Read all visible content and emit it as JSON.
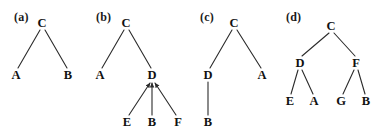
{
  "figure": {
    "width": 388,
    "height": 136,
    "background": "#ffffff",
    "stroke_color": "#2b2b2b",
    "text_color": "#111111"
  },
  "panels": [
    {
      "id": "panel-a",
      "label": "(a)",
      "label_x": 14,
      "label_y": 10,
      "nodes": [
        {
          "name": "C",
          "x": 42,
          "y": 23
        },
        {
          "name": "A",
          "x": 16,
          "y": 75
        },
        {
          "name": "B",
          "x": 68,
          "y": 75
        }
      ],
      "edges": [
        {
          "from": "C",
          "to": "A",
          "x1": 40,
          "y1": 30,
          "x2": 18,
          "y2": 68,
          "arrow": false
        },
        {
          "from": "C",
          "to": "B",
          "x1": 45,
          "y1": 30,
          "x2": 67,
          "y2": 68,
          "arrow": false
        }
      ]
    },
    {
      "id": "panel-b",
      "label": "(b)",
      "label_x": 96,
      "label_y": 10,
      "nodes": [
        {
          "name": "C",
          "x": 126,
          "y": 23
        },
        {
          "name": "A",
          "x": 100,
          "y": 75
        },
        {
          "name": "D",
          "x": 152,
          "y": 75
        },
        {
          "name": "E",
          "x": 127,
          "y": 122
        },
        {
          "name": "B",
          "x": 152,
          "y": 122
        },
        {
          "name": "F",
          "x": 178,
          "y": 122
        }
      ],
      "edges": [
        {
          "from": "C",
          "to": "A",
          "x1": 124,
          "y1": 30,
          "x2": 102,
          "y2": 68,
          "arrow": false
        },
        {
          "from": "C",
          "to": "D",
          "x1": 129,
          "y1": 30,
          "x2": 151,
          "y2": 68,
          "arrow": false
        },
        {
          "from": "E",
          "to": "D",
          "x1": 129,
          "y1": 115,
          "x2": 150,
          "y2": 83,
          "arrow": true
        },
        {
          "from": "B",
          "to": "D",
          "x1": 152,
          "y1": 115,
          "x2": 152,
          "y2": 83,
          "arrow": true
        },
        {
          "from": "F",
          "to": "D",
          "x1": 176,
          "y1": 115,
          "x2": 155,
          "y2": 83,
          "arrow": true
        }
      ]
    },
    {
      "id": "panel-c",
      "label": "(c)",
      "label_x": 200,
      "label_y": 10,
      "nodes": [
        {
          "name": "C",
          "x": 234,
          "y": 23
        },
        {
          "name": "D",
          "x": 208,
          "y": 75
        },
        {
          "name": "A",
          "x": 262,
          "y": 75
        },
        {
          "name": "B",
          "x": 208,
          "y": 122
        }
      ],
      "edges": [
        {
          "from": "C",
          "to": "D",
          "x1": 232,
          "y1": 30,
          "x2": 210,
          "y2": 68,
          "arrow": false
        },
        {
          "from": "C",
          "to": "A",
          "x1": 237,
          "y1": 30,
          "x2": 261,
          "y2": 68,
          "arrow": false
        },
        {
          "from": "D",
          "to": "B",
          "x1": 208,
          "y1": 82,
          "x2": 208,
          "y2": 115,
          "arrow": false
        }
      ]
    },
    {
      "id": "panel-d",
      "label": "(d)",
      "label_x": 286,
      "label_y": 10,
      "nodes": [
        {
          "name": "C",
          "x": 331,
          "y": 26
        },
        {
          "name": "D",
          "x": 300,
          "y": 63
        },
        {
          "name": "F",
          "x": 356,
          "y": 63
        },
        {
          "name": "E",
          "x": 290,
          "y": 101
        },
        {
          "name": "A",
          "x": 314,
          "y": 101
        },
        {
          "name": "G",
          "x": 341,
          "y": 101
        },
        {
          "name": "B",
          "x": 366,
          "y": 101
        }
      ],
      "edges": [
        {
          "from": "C",
          "to": "D",
          "x1": 329,
          "y1": 33,
          "x2": 302,
          "y2": 56,
          "arrow": false
        },
        {
          "from": "C",
          "to": "F",
          "x1": 334,
          "y1": 33,
          "x2": 355,
          "y2": 56,
          "arrow": false
        },
        {
          "from": "D",
          "to": "E",
          "x1": 298,
          "y1": 70,
          "x2": 291,
          "y2": 94,
          "arrow": false
        },
        {
          "from": "D",
          "to": "A",
          "x1": 302,
          "y1": 70,
          "x2": 313,
          "y2": 94,
          "arrow": false
        },
        {
          "from": "F",
          "to": "G",
          "x1": 354,
          "y1": 70,
          "x2": 343,
          "y2": 94,
          "arrow": false
        },
        {
          "from": "F",
          "to": "B",
          "x1": 358,
          "y1": 70,
          "x2": 365,
          "y2": 94,
          "arrow": false
        }
      ]
    }
  ]
}
